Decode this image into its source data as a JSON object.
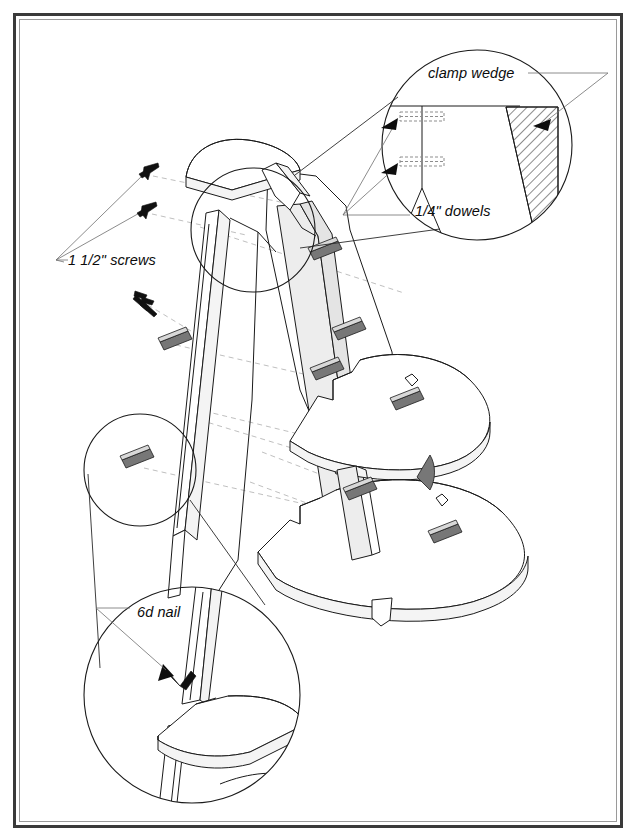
{
  "document": {
    "type": "exploded-assembly-woodworking-drawing",
    "subject": "corner shelf unit with curved shelves and tapered legs",
    "background_color": "#ffffff",
    "line_color": "#1a1a1a",
    "border_color": "#3a3a3a"
  },
  "frame": {
    "outer_border_label": "page-border",
    "inner_border_label": "page-inner-rule"
  },
  "callouts": [
    {
      "id": "clamp-wedge",
      "text": "clamp wedge",
      "x": 428,
      "y": 78,
      "points_to": "hatched tapered wedge in upper detail circle"
    },
    {
      "id": "quarter-inch-dowels",
      "text": "1/4\" dowels",
      "x": 415,
      "y": 216,
      "points_to": "dashed dowel markers in upper detail circle"
    },
    {
      "id": "one-and-a-half-inch-screws",
      "text": "1 1/2\" screws",
      "x": 68,
      "y": 265,
      "points_to": "three screw fasteners at upper left"
    },
    {
      "id": "six-d-nail",
      "text": "6d nail",
      "x": 137,
      "y": 617,
      "points_to": "nail joining leg to lower shelf in bottom detail circle"
    }
  ],
  "detail_views": [
    {
      "id": "upper-detail",
      "name": "clamp-wedge-and-dowel-detail",
      "center_x": 477,
      "center_y": 145,
      "radius": 95,
      "contains": [
        "clamp wedge",
        "1/4\" dowels"
      ]
    },
    {
      "id": "lower-detail",
      "name": "nail-joint-detail",
      "center_x": 192,
      "center_y": 695,
      "radius": 108,
      "contains": [
        "6d nail"
      ]
    },
    {
      "id": "left-leg-detail",
      "name": "leg-biscuit-detail",
      "center_x": 140,
      "center_y": 470,
      "radius": 56,
      "contains": [
        "biscuit slot on left leg"
      ]
    },
    {
      "id": "post-detail",
      "name": "center-post-detail",
      "center_x": 253,
      "center_y": 230,
      "radius": 62,
      "contains": [
        "center post top joint"
      ]
    }
  ],
  "fasteners": {
    "screws": [
      {
        "id": "screw-1",
        "x": 151,
        "y": 170
      },
      {
        "id": "screw-2",
        "x": 149,
        "y": 209
      },
      {
        "id": "screw-3",
        "x": 139,
        "y": 296
      },
      {
        "id": "screw-4",
        "x": 147,
        "y": 302
      }
    ],
    "nail": {
      "id": "nail-1",
      "x": 178,
      "y": 672
    },
    "biscuit_count": 9
  },
  "parts": {
    "top_shelf": "semicircular top cap",
    "middle_shelf": "semicircular middle shelf",
    "bottom_shelf": "semicircular bottom shelf",
    "left_leg": "tapered front-left leg",
    "right_leg": "tapered front-right leg",
    "center_post": "shaded back post",
    "back_panel": "shaded back panel"
  },
  "colors": {
    "shade_light": "#f4f4f4",
    "shade_mid": "#ededed",
    "shade_dark": "#e4e4e4",
    "biscuit": "#777777",
    "projection_line": "#b8b8b8",
    "leader_line": "#6e6e6e"
  }
}
